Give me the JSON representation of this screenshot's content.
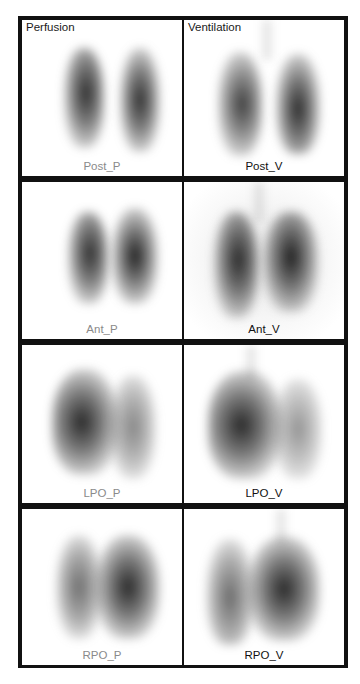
{
  "columns": [
    {
      "title": "Perfusion",
      "label_color": "#8a8a8a"
    },
    {
      "title": "Ventilation",
      "label_color": "#111111"
    }
  ],
  "panels": [
    {
      "label": "Post_P",
      "column": "Perfusion",
      "row": 1
    },
    {
      "label": "Post_V",
      "column": "Ventilation",
      "row": 1
    },
    {
      "label": "Ant_P",
      "column": "Perfusion",
      "row": 2
    },
    {
      "label": "Ant_V",
      "column": "Ventilation",
      "row": 2
    },
    {
      "label": "LPO_P",
      "column": "Perfusion",
      "row": 3
    },
    {
      "label": "LPO_V",
      "column": "Ventilation",
      "row": 3
    },
    {
      "label": "RPO_P",
      "column": "Perfusion",
      "row": 4
    },
    {
      "label": "RPO_V",
      "column": "Ventilation",
      "row": 4
    }
  ],
  "colors": {
    "frame": "#111111",
    "panel_background": "#ffffff",
    "scan_tone": "#2a2a2a"
  }
}
